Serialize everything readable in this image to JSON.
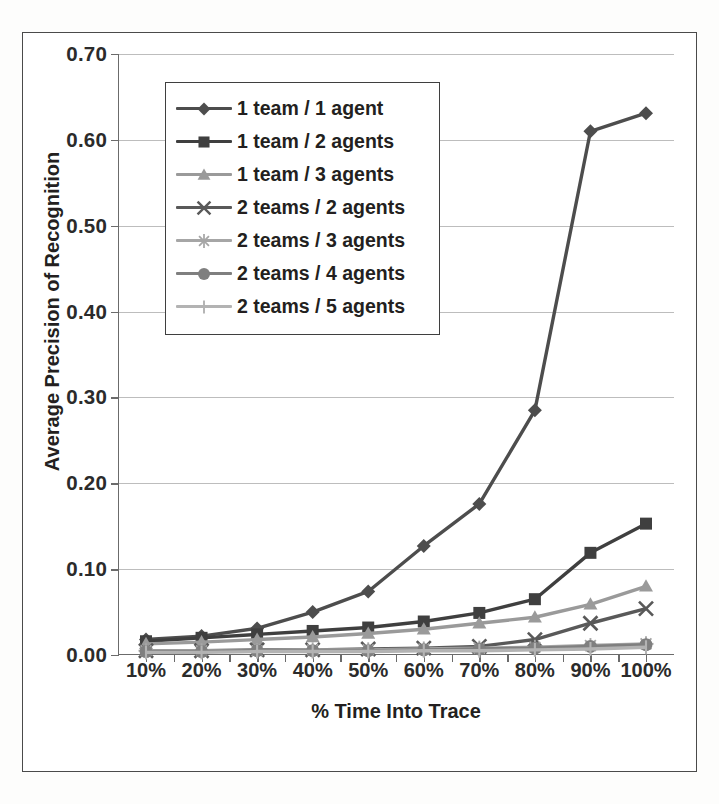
{
  "chart_data": {
    "type": "line",
    "title": "",
    "xlabel": "% Time Into Trace",
    "ylabel": "Average Precision of Recognition",
    "categories": [
      "10%",
      "20%",
      "30%",
      "40%",
      "50%",
      "60%",
      "70%",
      "80%",
      "90%",
      "100%"
    ],
    "ylim": [
      0.0,
      0.7
    ],
    "yticks": [
      "0.00",
      "0.10",
      "0.20",
      "0.30",
      "0.40",
      "0.50",
      "0.60",
      "0.70"
    ],
    "ytick_values": [
      0.0,
      0.1,
      0.2,
      0.3,
      0.4,
      0.5,
      0.6,
      0.7
    ],
    "grid": true,
    "legend_position": "upper-left-inside",
    "series": [
      {
        "name": "1 team / 1 agent",
        "marker": "diamond",
        "color": "#4d4d4d",
        "values": [
          0.018,
          0.022,
          0.031,
          0.05,
          0.074,
          0.127,
          0.176,
          0.285,
          0.61,
          0.631
        ]
      },
      {
        "name": "1 team / 2 agents",
        "marker": "square",
        "color": "#3f3f3f",
        "values": [
          0.016,
          0.02,
          0.024,
          0.028,
          0.032,
          0.039,
          0.049,
          0.065,
          0.119,
          0.153
        ]
      },
      {
        "name": "1 team / 3 agents",
        "marker": "triangle",
        "color": "#9a9a9a",
        "values": [
          0.013,
          0.015,
          0.018,
          0.021,
          0.025,
          0.03,
          0.037,
          0.044,
          0.059,
          0.08
        ]
      },
      {
        "name": "2 teams / 2 agents",
        "marker": "x",
        "color": "#595959",
        "values": [
          0.005,
          0.005,
          0.006,
          0.006,
          0.007,
          0.008,
          0.01,
          0.018,
          0.037,
          0.054
        ]
      },
      {
        "name": "2 teams / 3 agents",
        "marker": "star",
        "color": "#a6a6a6",
        "values": [
          0.005,
          0.005,
          0.005,
          0.006,
          0.006,
          0.007,
          0.008,
          0.009,
          0.011,
          0.013
        ]
      },
      {
        "name": "2 teams / 4 agents",
        "marker": "circle",
        "color": "#7f7f7f",
        "values": [
          0.004,
          0.004,
          0.005,
          0.005,
          0.005,
          0.006,
          0.007,
          0.008,
          0.01,
          0.012
        ]
      },
      {
        "name": "2 teams / 5 agents",
        "marker": "plus",
        "color": "#b3b3b3",
        "values": [
          0.003,
          0.003,
          0.004,
          0.004,
          0.004,
          0.005,
          0.005,
          0.006,
          0.007,
          0.009
        ]
      }
    ]
  }
}
